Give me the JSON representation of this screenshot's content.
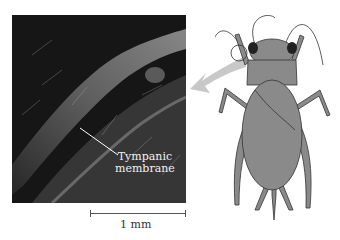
{
  "figure": {
    "photo": {
      "description": "Scanning electron micrograph of cricket foreleg showing tympanic membrane",
      "label": {
        "line1": "Tympanic",
        "line2": "membrane"
      }
    },
    "scale_bar": {
      "label": "1 mm"
    },
    "illustration": {
      "subject": "cricket",
      "highlight": "circle on foreleg tibia (ear location)",
      "arrow": "curved arrow pointing from cricket leg to micrograph"
    },
    "colors": {
      "photo_bg": "#1a1a1a",
      "cricket_body": "#8a8a8a",
      "arrow": "#c8c8c8",
      "text_dark": "#333333",
      "text_light": "#f2f2f2"
    }
  }
}
